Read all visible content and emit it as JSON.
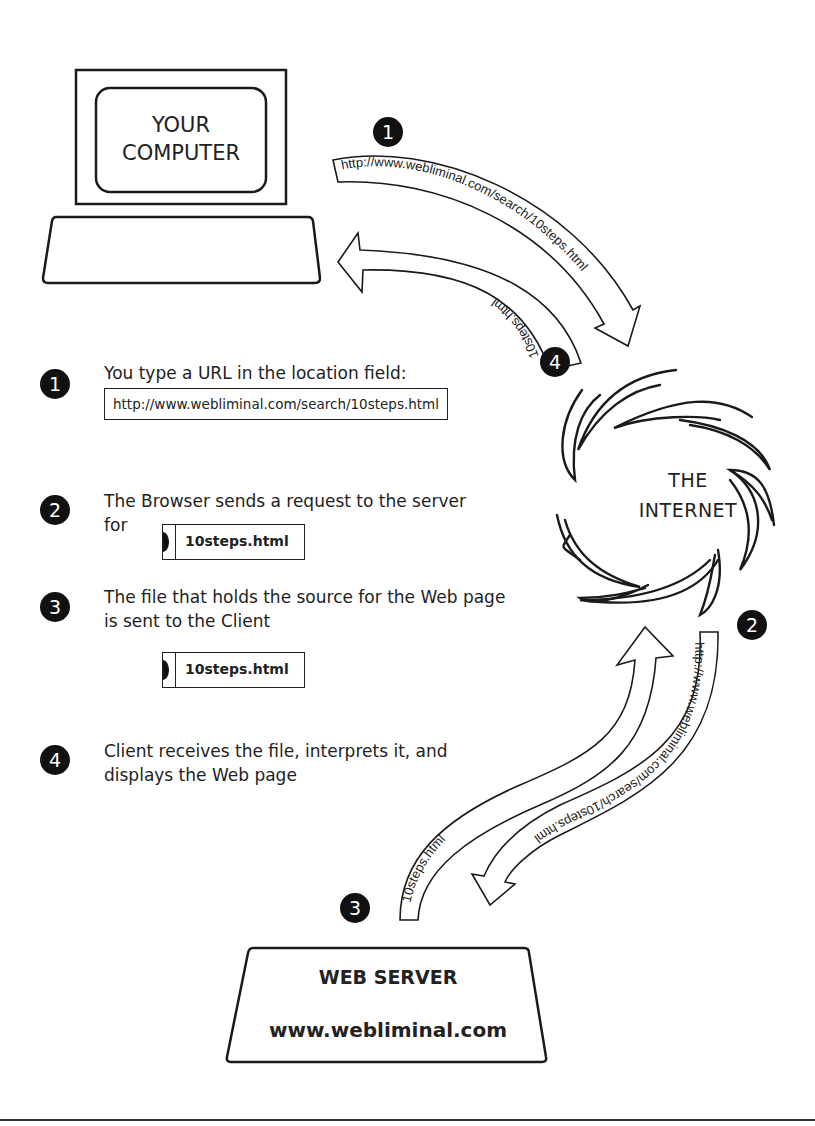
{
  "computer": {
    "label_line1": "YOUR",
    "label_line2": "COMPUTER"
  },
  "internet": {
    "label_line1": "THE",
    "label_line2": "INTERNET"
  },
  "server": {
    "title": "WEB SERVER",
    "domain": "www.webliminal.com"
  },
  "arrows": {
    "request_top": "http://www.webliminal.com/search/10steps.html",
    "response_top": "10steps.html",
    "request_bottom": "http://www.webliminal.com/search/10steps.html",
    "response_bottom": "10steps.html"
  },
  "badges": {
    "arrow_1": "1",
    "arrow_2": "2",
    "arrow_3": "3",
    "arrow_4": "4"
  },
  "steps": [
    {
      "number": "1",
      "text": "You type a URL in the location field:",
      "url": "http://www.webliminal.com/search/10steps.html"
    },
    {
      "number": "2",
      "text_line1": "The Browser sends a request to the server",
      "text_line2": "for",
      "file": "10steps.html"
    },
    {
      "number": "3",
      "text_line1": "The file that holds the source for the Web page",
      "text_line2": "is sent to the Client",
      "file": "10steps.html"
    },
    {
      "number": "4",
      "text_line1": "Client receives the file, interprets it, and",
      "text_line2": "displays the Web page"
    }
  ],
  "colors": {
    "ink": "#1a1a1a",
    "background": "#ffffff"
  }
}
